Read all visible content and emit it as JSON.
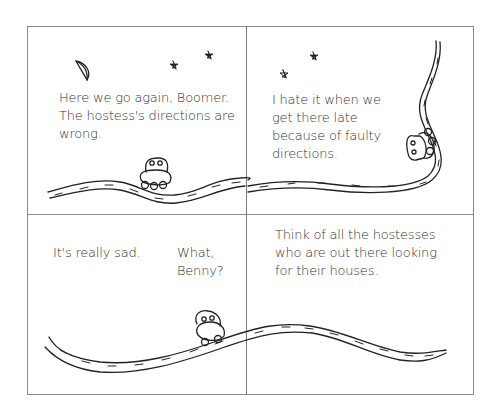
{
  "comic": {
    "panels": [
      {
        "id": 1,
        "caption_lines": [
          "Here we go again, Boomer.",
          "The hostess's directions are",
          "wrong."
        ],
        "elements": [
          "moon",
          "star",
          "star",
          "road",
          "car"
        ]
      },
      {
        "id": 2,
        "caption_lines": [
          "I hate it when we",
          "get there late",
          "because of faulty",
          "directions."
        ],
        "elements": [
          "star",
          "star",
          "winding-road",
          "car"
        ]
      },
      {
        "id": 3,
        "captions": [
          {
            "lines": [
              "It's really sad."
            ]
          },
          {
            "lines": [
              "What,",
              "Benny?"
            ]
          }
        ],
        "elements": [
          "road",
          "car"
        ]
      },
      {
        "id": 4,
        "caption_lines": [
          "Think of all the hostesses",
          "who are out there looking",
          "for their houses."
        ],
        "elements": [
          "road"
        ]
      }
    ],
    "colors": {
      "ink": "#222222",
      "border": "#8a8a8a",
      "background": "#ffffff"
    }
  }
}
